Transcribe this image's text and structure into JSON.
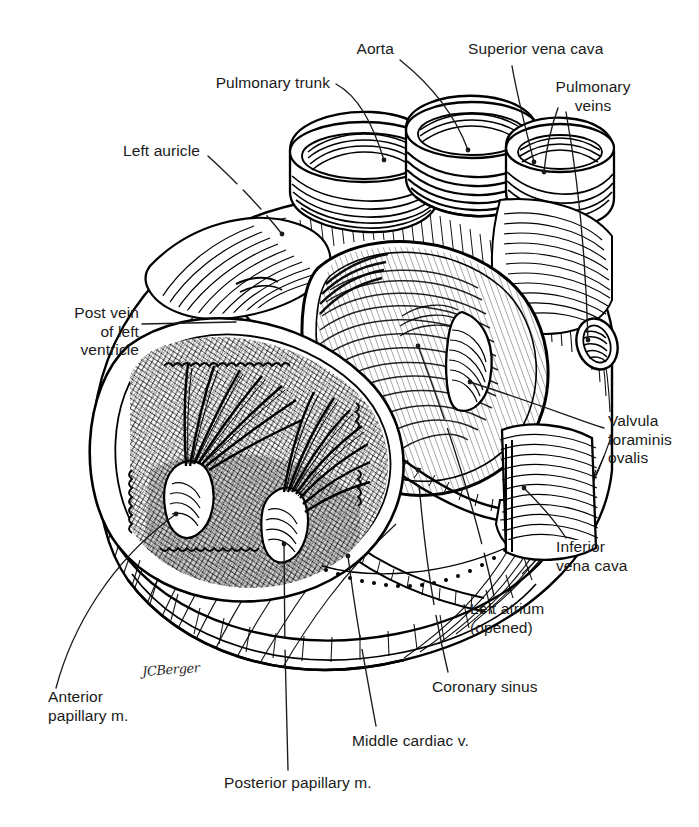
{
  "figure": {
    "type": "anatomical-line-illustration",
    "medium": "pen-and-ink stipple and hatching",
    "background_color": "#ffffff",
    "ink_color": "#000000",
    "signature": "JCBerger"
  },
  "labels": {
    "pulmonary_trunk": "Pulmonary trunk",
    "aorta": "Aorta",
    "superior_vena_cava": "Superior vena cava",
    "pulmonary_veins": "Pulmonary\nveins",
    "left_auricle": "Left auricle",
    "post_vein_left_ventricle": "Post vein\nof left\nventricle",
    "valvula_foraminis_ovalis": "Valvula\nforaminis\novalis",
    "inferior_vena_cava": "Inferior\nvena cava",
    "left_atrium_opened": "Left atrium\n(opened)",
    "coronary_sinus": "Coronary sinus",
    "middle_cardiac_vein": "Middle cardiac v.",
    "anterior_papillary_muscle": "Anterior\npapillary m.",
    "posterior_papillary_muscle": "Posterior papillary m."
  },
  "structures": [
    {
      "name": "Pulmonary trunk",
      "kind": "great-vessel-stump",
      "note": "cut ring, left of aorta"
    },
    {
      "name": "Aorta",
      "kind": "great-vessel-stump",
      "note": "cut ring, center, heavily ridged"
    },
    {
      "name": "Superior vena cava",
      "kind": "great-vessel-stump",
      "note": "cut ring, right of aorta"
    },
    {
      "name": "Pulmonary veins",
      "kind": "vein-stumps",
      "note": "right posterior, two openings"
    },
    {
      "name": "Left auricle",
      "kind": "atrial-appendage",
      "note": "left upper, pectinate ridging"
    },
    {
      "name": "Left atrium (opened)",
      "kind": "chamber",
      "note": "posterior wall reflected, smooth endocardium"
    },
    {
      "name": "Valvula foraminis ovalis",
      "kind": "valve-flap",
      "note": "crescentic flap on atrial septum"
    },
    {
      "name": "Inferior vena cava",
      "kind": "great-vessel",
      "note": "lower right trunk"
    },
    {
      "name": "Coronary sinus",
      "kind": "vein",
      "note": "atrioventricular groove"
    },
    {
      "name": "Middle cardiac v.",
      "kind": "vein",
      "note": "posterior interventricular groove"
    },
    {
      "name": "Post vein of left ventricle",
      "kind": "vein",
      "note": "left lateral surface"
    },
    {
      "name": "Anterior papillary m.",
      "kind": "papillary-muscle",
      "note": "left, chordae tendineae fan"
    },
    {
      "name": "Posterior papillary m.",
      "kind": "papillary-muscle",
      "note": "right, chordae tendineae fan"
    }
  ]
}
